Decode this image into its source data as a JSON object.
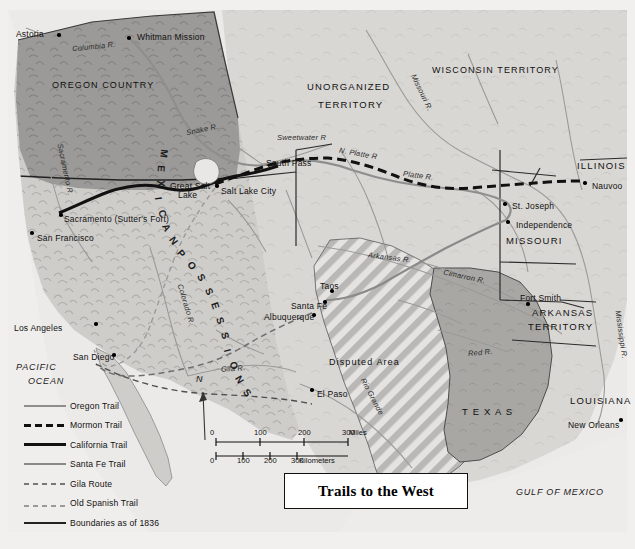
{
  "title": "Trails to the West",
  "regions": [
    {
      "name": "OREGON COUNTRY",
      "x": 52,
      "y": 80
    },
    {
      "name": "UNORGANIZED",
      "x": 307,
      "y": 81
    },
    {
      "name": "TERRITORY",
      "x": 318,
      "y": 99
    },
    {
      "name": "WISCONSIN TERRITORY",
      "x": 432,
      "y": 65
    },
    {
      "name": "ILLINOIS",
      "x": 577,
      "y": 160
    },
    {
      "name": "MISSOURI",
      "x": 506,
      "y": 235
    },
    {
      "name": "ARKANSAS",
      "x": 532,
      "y": 307
    },
    {
      "name": "TERRITORY",
      "x": 528,
      "y": 321
    },
    {
      "name": "LOUISIANA",
      "x": 570,
      "y": 395
    },
    {
      "name": "T E X A S",
      "x": 462,
      "y": 406
    },
    {
      "name": "Disputed Area",
      "x": 329,
      "y": 357
    }
  ],
  "mexican_possessions": "MEXICAN POSSESSIONS",
  "oceans": [
    {
      "name": "PACIFIC",
      "x": 16,
      "y": 362
    },
    {
      "name": "OCEAN",
      "x": 28,
      "y": 376
    },
    {
      "name": "GULF OF MEXICO",
      "x": 516,
      "y": 487
    }
  ],
  "cities": [
    {
      "name": "Astoria",
      "lx": 16,
      "ly": 29,
      "dx": 57,
      "dy": 33,
      "align": "left"
    },
    {
      "name": "Whitman Mission",
      "lx": 137,
      "ly": 32,
      "dx": 127,
      "dy": 36,
      "align": "left"
    },
    {
      "name": "Salt Lake City",
      "lx": 221,
      "ly": 186,
      "dx": 215,
      "dy": 184,
      "align": "left"
    },
    {
      "name": "Sacramento (Sutter's Fort)",
      "lx": 64,
      "ly": 214,
      "dx": 59,
      "dy": 213,
      "align": "left"
    },
    {
      "name": "San Francisco",
      "lx": 37,
      "ly": 233,
      "dx": 30,
      "dy": 231,
      "align": "left"
    },
    {
      "name": "Los Angeles",
      "lx": 14,
      "ly": 323,
      "dx": 94,
      "dy": 322,
      "align": "left"
    },
    {
      "name": "San Diego",
      "lx": 73,
      "ly": 352,
      "dx": 112,
      "dy": 353,
      "align": "left"
    },
    {
      "name": "El Paso",
      "lx": 317,
      "ly": 389,
      "dx": 310,
      "dy": 388,
      "align": "left"
    },
    {
      "name": "Taos",
      "lx": 320,
      "ly": 281,
      "dx": 330,
      "dy": 289,
      "align": "left"
    },
    {
      "name": "Santa Fe",
      "lx": 291,
      "ly": 301,
      "dx": 323,
      "dy": 300,
      "align": "left"
    },
    {
      "name": "Albuquerque",
      "lx": 264,
      "ly": 312,
      "dx": 312,
      "dy": 313,
      "align": "left"
    },
    {
      "name": "St. Joseph",
      "lx": 512,
      "ly": 201,
      "dx": 503,
      "dy": 202,
      "align": "left"
    },
    {
      "name": "Independence",
      "lx": 516,
      "ly": 220,
      "dx": 506,
      "dy": 220,
      "align": "left"
    },
    {
      "name": "Nauvoo",
      "lx": 592,
      "ly": 181,
      "dx": 583,
      "dy": 181,
      "align": "left"
    },
    {
      "name": "Fort Smith",
      "lx": 520,
      "ly": 293,
      "dx": 526,
      "dy": 302,
      "align": "left"
    },
    {
      "name": "New Orleans",
      "lx": 568,
      "ly": 420,
      "dx": 619,
      "dy": 418,
      "align": "left"
    }
  ],
  "places": [
    {
      "name": "South Pass",
      "x": 266,
      "y": 158
    },
    {
      "name": "Great Salt",
      "x": 170,
      "y": 181
    },
    {
      "name": "Lake",
      "x": 178,
      "y": 190
    }
  ],
  "rivers": [
    {
      "name": "Columbia R.",
      "x": 72,
      "y": 42,
      "rot": -6
    },
    {
      "name": "Snake R.",
      "x": 186,
      "y": 125,
      "rot": -12
    },
    {
      "name": "Sweetwater R",
      "x": 277,
      "y": 133,
      "rot": 0
    },
    {
      "name": "N. Platte R",
      "x": 339,
      "y": 149,
      "rot": 10
    },
    {
      "name": "Platte R.",
      "x": 403,
      "y": 171,
      "rot": 7
    },
    {
      "name": "Missouri R.",
      "x": 402,
      "y": 88,
      "rot": 64
    },
    {
      "name": "Sacramento R.",
      "x": 39,
      "y": 165,
      "rot": 78
    },
    {
      "name": "Colorado R.",
      "x": 165,
      "y": 300,
      "rot": 73
    },
    {
      "name": "Gila R.",
      "x": 221,
      "y": 364,
      "rot": -4
    },
    {
      "name": "Arkansas R.",
      "x": 368,
      "y": 253,
      "rot": 7
    },
    {
      "name": "Cimarron R.",
      "x": 443,
      "y": 272,
      "rot": 12
    },
    {
      "name": "Red R.",
      "x": 468,
      "y": 348,
      "rot": -5
    },
    {
      "name": "Rio Grande",
      "x": 352,
      "y": 392,
      "rot": 62
    },
    {
      "name": "Mississippi R.",
      "x": 597,
      "y": 330,
      "rot": 82
    }
  ],
  "legend": {
    "items": [
      {
        "label": "Oregon Trail",
        "key": "k-oregon"
      },
      {
        "label": "Mormon Trail",
        "key": "k-mormon"
      },
      {
        "label": "California Trail",
        "key": "k-california"
      },
      {
        "label": "Santa Fe Trail",
        "key": "k-santafe"
      },
      {
        "label": "Gila Route",
        "key": "k-gila"
      },
      {
        "label": "Old Spanish Trail",
        "key": "k-spanish"
      },
      {
        "label": "Boundaries as of 1836",
        "key": "k-bound"
      }
    ]
  },
  "scale": {
    "miles_ticks": [
      "0",
      "100",
      "200",
      "300"
    ],
    "miles_unit": "Miles",
    "km_ticks": [
      "0",
      "100",
      "200",
      "300"
    ],
    "km_unit": "Kilometers"
  },
  "north_arrow": {
    "label": "N"
  },
  "colors": {
    "page_bg": "#f2f0ee",
    "land_light": "#d9d7d4",
    "land_west": "#c9c7c4",
    "oregon_fill": "#9a9a99",
    "texas_fill": "#a5a4a2",
    "water": "#efeeec",
    "hatch": "#b4b3b1",
    "trail_black": "#111111",
    "trail_gray": "#8e8e8e"
  }
}
